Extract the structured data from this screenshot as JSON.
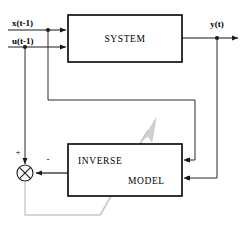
{
  "diagram": {
    "blocks": [
      {
        "id": "system",
        "label": "SYSTEM",
        "x": 68,
        "y": 15,
        "w": 114,
        "h": 47
      },
      {
        "id": "inverse_model",
        "label_line1": "INVERSE",
        "label_line2": "MODEL",
        "x": 68,
        "y": 144,
        "w": 114,
        "h": 52
      }
    ],
    "signals": {
      "input_state": "x(t-1)",
      "input_control": "u(t-1)",
      "output": "y(t)"
    },
    "summing_junction": {
      "name": "error-summing-junction",
      "glyph": "circle-with-x",
      "plus_sign": "+",
      "minus_sign": "-",
      "cx": 25,
      "cy": 173,
      "r": 8
    },
    "colors": {
      "wire": "#1a1a1a",
      "box_stroke": "#000000",
      "box_fill": "#ffffff",
      "background": "#ffffff",
      "training_path": "#c9c9c9"
    }
  }
}
